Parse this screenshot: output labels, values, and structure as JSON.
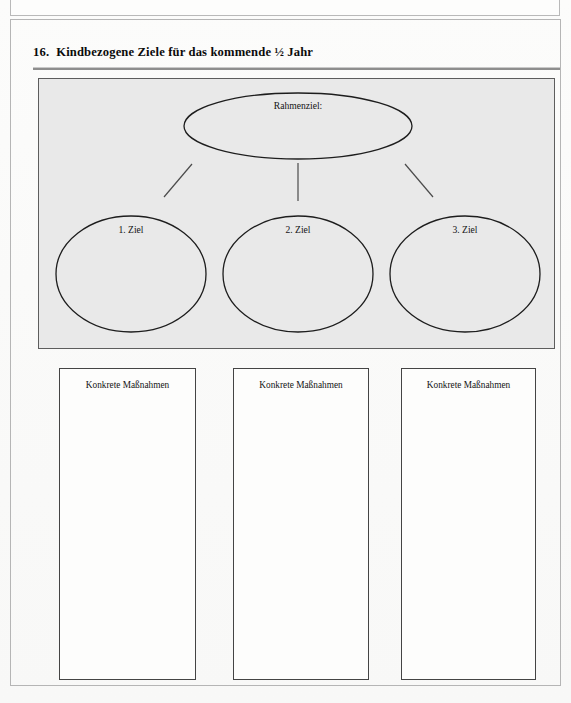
{
  "document": {
    "language": "de",
    "page_background": "#fbfbfa"
  },
  "top_partial_section": {
    "rule_color": "#1a1a1a"
  },
  "section": {
    "number": "16.",
    "title": "Kindbezogene Ziele für das kommende ½ Jahr",
    "rule_color": "#8e8e8e"
  },
  "diagram": {
    "panel_background": "#e9e9e9",
    "panel_border_color": "#5d5d5d",
    "frame_goal": {
      "label": "Rahmenziel:",
      "shape": "ellipse"
    },
    "goals": [
      {
        "label": "1. Ziel",
        "shape": "ellipse"
      },
      {
        "label": "2. Ziel",
        "shape": "ellipse"
      },
      {
        "label": "3. Ziel",
        "shape": "ellipse"
      }
    ],
    "connectors": [
      {
        "kind": "diagonal-left"
      },
      {
        "kind": "vertical-center"
      },
      {
        "kind": "diagonal-right"
      }
    ]
  },
  "measures": {
    "boxes": [
      {
        "label": "Konkrete Maßnahmen",
        "value": ""
      },
      {
        "label": "Konkrete Maßnahmen",
        "value": ""
      },
      {
        "label": "Konkrete Maßnahmen",
        "value": ""
      }
    ]
  }
}
